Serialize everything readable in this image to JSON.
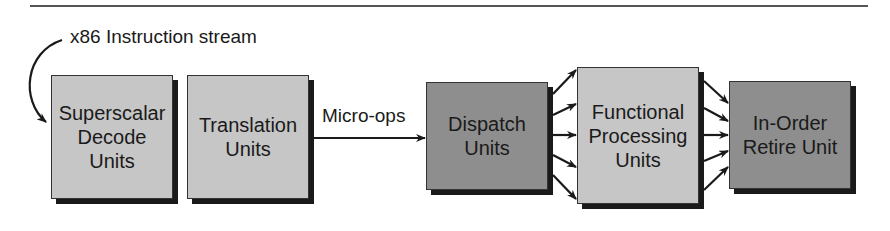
{
  "diagram": {
    "input_label": "x86 Instruction stream",
    "edge_label": "Micro-ops",
    "boxes": [
      {
        "id": "decode",
        "label": "Superscalar\nDecode\nUnits",
        "shade": "light"
      },
      {
        "id": "translation",
        "label": "Translation\nUnits",
        "shade": "light"
      },
      {
        "id": "dispatch",
        "label": "Dispatch\nUnits",
        "shade": "dark"
      },
      {
        "id": "functional",
        "label": "Functional\nProcessing\nUnits",
        "shade": "light"
      },
      {
        "id": "retire",
        "label": "In-Order\nRetire Unit",
        "shade": "dark"
      }
    ],
    "edges": [
      {
        "from": "x86 Instruction stream",
        "to": "decode",
        "style": "curved"
      },
      {
        "from": "translation",
        "to": "dispatch",
        "label": "Micro-ops"
      },
      {
        "from": "dispatch",
        "to": "functional",
        "count": 5
      },
      {
        "from": "functional",
        "to": "retire",
        "count": 5
      }
    ],
    "colors": {
      "light_box": "#c6c6c6",
      "dark_box": "#8e8e8e",
      "line": "#1a1a1a"
    }
  }
}
